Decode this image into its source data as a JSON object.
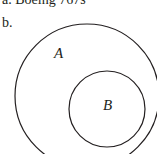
{
  "captions": {
    "a": "a. Boeing 767s",
    "b": "b."
  },
  "diagram": {
    "type": "venn-subset",
    "outer_set": {
      "label": "A"
    },
    "inner_set": {
      "label": "B"
    },
    "stroke_color": "#231f20"
  }
}
